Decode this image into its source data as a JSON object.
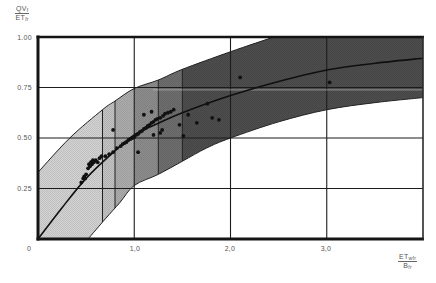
{
  "chart_data": {
    "type": "scatter",
    "title": "",
    "xlabel": "ET_wfr / B_fr",
    "ylabel": "QV_f / ET_fr",
    "xlabel_parts": {
      "num": "ET",
      "num_sub": "wfr",
      "den": "B",
      "den_sub": "fr"
    },
    "ylabel_parts": {
      "num": "QV",
      "num_sub": "f",
      "den": "ET",
      "den_sub": "fr"
    },
    "xlim": [
      0,
      4
    ],
    "ylim": [
      0,
      1
    ],
    "x_ticks": [
      {
        "value": 0,
        "label": "0"
      },
      {
        "value": 1,
        "label": "1,0"
      },
      {
        "value": 2,
        "label": "2,0"
      },
      {
        "value": 3,
        "label": "3,0"
      }
    ],
    "y_ticks": [
      {
        "value": 1.0,
        "label": "1.00"
      },
      {
        "value": 0.75,
        "label": "0.75"
      },
      {
        "value": 0.5,
        "label": "0.50"
      },
      {
        "value": 0.25,
        "label": "0.25"
      }
    ],
    "grid": {
      "x": [
        1,
        2,
        3
      ],
      "y": [
        0.25,
        0.5,
        0.75
      ]
    },
    "legend": null,
    "series": [
      {
        "name": "upper envelope",
        "type": "line",
        "points": [
          [
            0,
            0.33
          ],
          [
            0.33,
            0.5
          ],
          [
            0.67,
            0.64
          ],
          [
            0.8,
            0.683
          ],
          [
            1.0,
            0.745
          ],
          [
            1.25,
            0.787
          ],
          [
            1.5,
            0.84
          ],
          [
            2.0,
            0.927
          ],
          [
            2.45,
            1.0
          ]
        ]
      },
      {
        "name": "lower envelope",
        "type": "line",
        "points": [
          [
            0.52,
            0
          ],
          [
            0.7,
            0.1
          ],
          [
            0.85,
            0.18
          ],
          [
            1.0,
            0.265
          ],
          [
            1.25,
            0.32
          ],
          [
            1.5,
            0.385
          ],
          [
            1.75,
            0.45
          ],
          [
            2.0,
            0.5
          ],
          [
            2.5,
            0.58
          ],
          [
            3.0,
            0.64
          ],
          [
            3.5,
            0.675
          ],
          [
            4.0,
            0.7
          ]
        ]
      },
      {
        "name": "fitted curve",
        "type": "line",
        "points": [
          [
            0,
            0
          ],
          [
            0.25,
            0.155
          ],
          [
            0.5,
            0.3
          ],
          [
            0.75,
            0.415
          ],
          [
            1.0,
            0.515
          ],
          [
            1.25,
            0.573
          ],
          [
            1.5,
            0.625
          ],
          [
            2.0,
            0.71
          ],
          [
            2.5,
            0.78
          ],
          [
            3.0,
            0.837
          ],
          [
            3.5,
            0.87
          ],
          [
            4.0,
            0.895
          ]
        ]
      },
      {
        "name": "observations",
        "type": "scatter",
        "points": [
          [
            0.45,
            0.28
          ],
          [
            0.47,
            0.3
          ],
          [
            0.48,
            0.31
          ],
          [
            0.49,
            0.3
          ],
          [
            0.5,
            0.32
          ],
          [
            0.52,
            0.35
          ],
          [
            0.53,
            0.37
          ],
          [
            0.54,
            0.36
          ],
          [
            0.55,
            0.38
          ],
          [
            0.56,
            0.37
          ],
          [
            0.57,
            0.39
          ],
          [
            0.58,
            0.38
          ],
          [
            0.6,
            0.39
          ],
          [
            0.62,
            0.38
          ],
          [
            0.64,
            0.4
          ],
          [
            0.66,
            0.41
          ],
          [
            0.7,
            0.41
          ],
          [
            0.74,
            0.42
          ],
          [
            0.78,
            0.43
          ],
          [
            0.82,
            0.45
          ],
          [
            0.86,
            0.46
          ],
          [
            0.88,
            0.47
          ],
          [
            0.9,
            0.475
          ],
          [
            0.92,
            0.48
          ],
          [
            0.94,
            0.49
          ],
          [
            0.96,
            0.495
          ],
          [
            0.98,
            0.5
          ],
          [
            1.0,
            0.505
          ],
          [
            1.02,
            0.515
          ],
          [
            1.04,
            0.52
          ],
          [
            1.06,
            0.53
          ],
          [
            1.08,
            0.535
          ],
          [
            1.1,
            0.545
          ],
          [
            1.12,
            0.55
          ],
          [
            1.14,
            0.56
          ],
          [
            1.16,
            0.565
          ],
          [
            1.18,
            0.575
          ],
          [
            1.2,
            0.58
          ],
          [
            1.22,
            0.59
          ],
          [
            1.24,
            0.595
          ],
          [
            1.27,
            0.6
          ],
          [
            1.3,
            0.61
          ],
          [
            1.32,
            0.62
          ],
          [
            1.35,
            0.625
          ],
          [
            1.38,
            0.63
          ],
          [
            1.41,
            0.64
          ],
          [
            0.78,
            0.54
          ],
          [
            1.04,
            0.43
          ],
          [
            1.1,
            0.615
          ],
          [
            1.18,
            0.63
          ],
          [
            1.2,
            0.515
          ],
          [
            1.27,
            0.525
          ],
          [
            1.29,
            0.54
          ],
          [
            1.47,
            0.565
          ],
          [
            1.51,
            0.51
          ],
          [
            1.56,
            0.615
          ],
          [
            1.65,
            0.575
          ],
          [
            1.76,
            0.67
          ],
          [
            1.81,
            0.6
          ],
          [
            1.88,
            0.59
          ],
          [
            2.1,
            0.8
          ],
          [
            3.03,
            0.775
          ]
        ]
      }
    ],
    "bands": [
      {
        "x0": 0,
        "x1": 0.67,
        "color": "#d3d3d3"
      },
      {
        "x0": 0.67,
        "x1": 0.8,
        "color": "#c3c3c3"
      },
      {
        "x0": 0.8,
        "x1": 1.0,
        "color": "#adadad"
      },
      {
        "x0": 1.0,
        "x1": 1.25,
        "color": "#8d8d8d"
      },
      {
        "x0": 1.25,
        "x1": 1.5,
        "color": "#6e6e6e"
      },
      {
        "x0": 1.5,
        "x1": 4.0,
        "color": "#4d4d4d"
      }
    ],
    "band_dividers": [
      0.67,
      0.8,
      1.25,
      1.5
    ],
    "reference_line": {
      "y": 0.738,
      "x_start": 1.2,
      "x_end": 4.0,
      "style": "dotted",
      "color": "#bdbdbd"
    },
    "colors": {
      "axis": "#141414",
      "grid": "#1c1c1c",
      "curve": "#101010",
      "points": "#111111"
    }
  }
}
